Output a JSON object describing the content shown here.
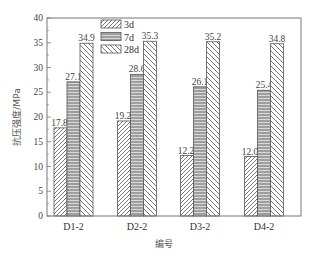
{
  "chart_data": {
    "type": "bar",
    "title": "",
    "xlabel": "编号",
    "ylabel": "抗压强度/MPa",
    "ylim": [
      0,
      40
    ],
    "yticks": [
      0,
      5,
      10,
      15,
      20,
      25,
      30,
      35,
      40
    ],
    "grid": false,
    "legend_position": "upper-left-inside",
    "categories": [
      "D1-2",
      "D2-2",
      "D3-2",
      "D4-2"
    ],
    "series": [
      {
        "name": "3d",
        "pattern": "diagonal-up",
        "values": [
          17.8,
          19.2,
          12.2,
          12.0
        ]
      },
      {
        "name": "7d",
        "pattern": "horizontal",
        "values": [
          27.1,
          28.6,
          26.1,
          25.4
        ]
      },
      {
        "name": "28d",
        "pattern": "diagonal-down",
        "values": [
          34.9,
          35.3,
          35.2,
          34.8
        ]
      }
    ],
    "value_labels": [
      [
        "17.8",
        "27.1",
        "34.9"
      ],
      [
        "19.2",
        "28.6",
        "35.3"
      ],
      [
        "12.2",
        "26.1",
        "35.2"
      ],
      [
        "12.0",
        "25.4",
        "34.8"
      ]
    ]
  },
  "colors": {
    "axis": "#666666",
    "bar_stroke": "#444444",
    "hatch": "#555555"
  }
}
